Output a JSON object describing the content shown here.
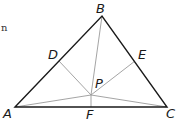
{
  "diagram": {
    "type": "triangle-with-interior-point",
    "fragment_text": "n",
    "colors": {
      "triangle": "#1a1a1a",
      "segments": "#9a9a9a",
      "background": "#ffffff"
    },
    "points": {
      "A": {
        "label": "A",
        "x": 15,
        "y": 107
      },
      "B": {
        "label": "B",
        "x": 102,
        "y": 16
      },
      "C": {
        "label": "C",
        "x": 167,
        "y": 107
      },
      "D": {
        "label": "D",
        "x": 59,
        "y": 61
      },
      "E": {
        "label": "E",
        "x": 135,
        "y": 61
      },
      "F": {
        "label": "F",
        "x": 91,
        "y": 107
      },
      "P": {
        "label": "P",
        "x": 91,
        "y": 95
      }
    },
    "segments": [
      [
        "A",
        "B"
      ],
      [
        "B",
        "C"
      ],
      [
        "C",
        "A"
      ],
      [
        "P",
        "A"
      ],
      [
        "P",
        "B"
      ],
      [
        "P",
        "C"
      ],
      [
        "P",
        "D"
      ],
      [
        "P",
        "E"
      ],
      [
        "P",
        "F"
      ]
    ]
  }
}
